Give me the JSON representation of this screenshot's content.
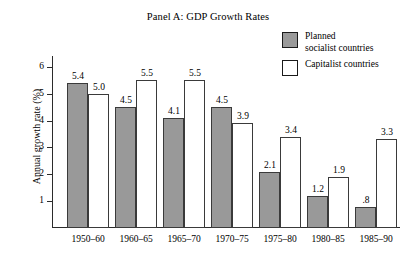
{
  "chart_data": {
    "type": "bar",
    "title": "Panel A: GDP Growth Rates",
    "xlabel": "",
    "ylabel": "Annual growth rate (%)",
    "ylim": [
      0,
      6.4
    ],
    "ytick_labels": [
      "1",
      "2",
      "3",
      "4",
      "5",
      "6"
    ],
    "ytick_values": [
      1,
      2,
      3,
      4,
      5,
      6
    ],
    "grid": false,
    "legend_position": "top-right",
    "categories": [
      "1950–60",
      "1960–65",
      "1965–70",
      "1970–75",
      "1975–80",
      "1980–85",
      "1985–90"
    ],
    "series": [
      {
        "name": "Planned\nsocialist countries",
        "color": "#999999",
        "values": [
          5.4,
          4.5,
          4.1,
          4.5,
          2.1,
          1.2,
          0.8
        ],
        "value_labels": [
          "5.4",
          "4.5",
          "4.1",
          "4.5",
          "2.1",
          "1.2",
          ".8"
        ]
      },
      {
        "name": "Capitalist countries",
        "color": "#ffffff",
        "values": [
          5.0,
          5.5,
          5.5,
          3.9,
          3.4,
          1.9,
          3.3
        ],
        "value_labels": [
          "5.0",
          "5.5",
          "5.5",
          "3.9",
          "3.4",
          "1.9",
          "3.3"
        ]
      }
    ]
  },
  "legend": {
    "items": [
      {
        "label": "Planned\nsocialist countries",
        "swatch": "filled-gray-swatch"
      },
      {
        "label": "Capitalist countries",
        "swatch": "hollow-white-swatch"
      }
    ]
  },
  "colors": {
    "planned_fill": "#999999",
    "capitalist_fill": "#ffffff",
    "axis": "#2b2b2b",
    "bar_outline": "#3a3a3a",
    "background": "#ffffff"
  }
}
